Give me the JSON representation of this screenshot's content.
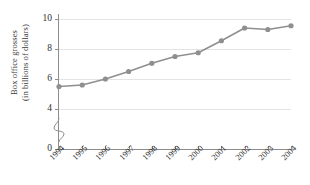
{
  "chart_data": {
    "type": "line",
    "title": "",
    "xlabel": "",
    "ylabel": "Box office grosses (in billions of dollars)",
    "ylabel_lines": [
      "Box office grosses",
      "(in billions of dollars)"
    ],
    "categories": [
      "1994",
      "1995",
      "1996",
      "1997",
      "1998",
      "1999",
      "2000",
      "2001",
      "2002",
      "2003",
      "2004"
    ],
    "values": [
      5.5,
      5.6,
      6.0,
      6.5,
      7.05,
      7.5,
      7.75,
      8.55,
      9.4,
      9.3,
      9.55
    ],
    "series": [
      {
        "name": "Box office grosses",
        "values": [
          5.5,
          5.6,
          6.0,
          6.5,
          7.05,
          7.5,
          7.75,
          8.55,
          9.4,
          9.3,
          9.55
        ]
      }
    ],
    "y_ticks": [
      0,
      4,
      6,
      8,
      10
    ],
    "y_tick_labels": [
      "0",
      "4",
      "6",
      "8",
      "10"
    ],
    "ylim": [
      0,
      10
    ],
    "gridlines": [
      4,
      6,
      8,
      10
    ],
    "grid": true,
    "axis_break": true,
    "axis_break_between": [
      0,
      4
    ],
    "legend": "none",
    "line_color": "#8f8f8f",
    "marker_color": "#8f8f8f",
    "marker_shape": "circle",
    "grid_color": "#e4e4e4",
    "axis_color": "#8d8d8d"
  }
}
